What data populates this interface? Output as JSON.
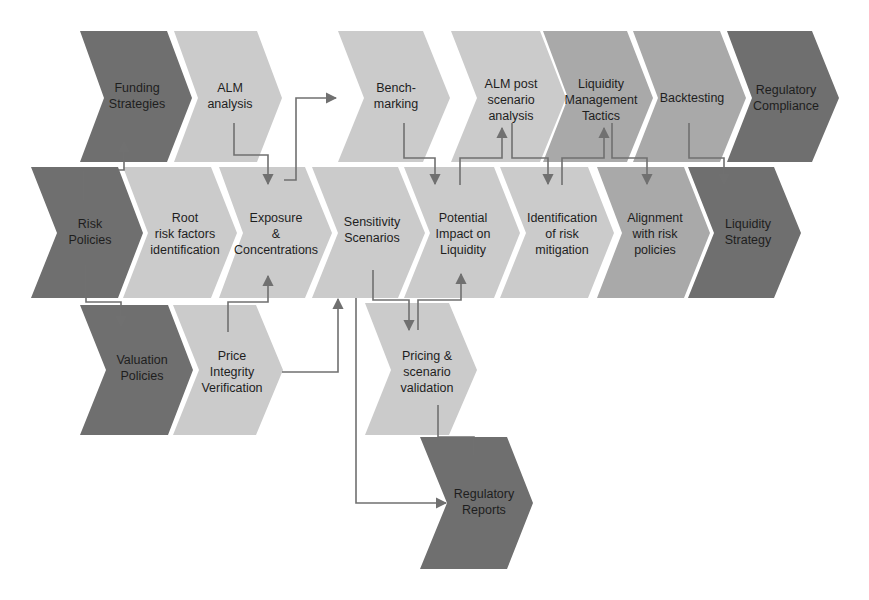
{
  "diagram": {
    "colors": {
      "dark": "#6f6f6f",
      "medium": "#a9a9a9",
      "light": "#cbcbcb",
      "connector": "#707070",
      "text": "#1e1e1e"
    },
    "rows": [
      {
        "name": "row-top",
        "items": [
          {
            "id": "funding-strategies",
            "label": "Funding\nStrategies",
            "shade": "dark"
          },
          {
            "id": "alm-analysis",
            "label": "ALM\nanalysis",
            "shade": "light"
          },
          {
            "id": "benchmarking",
            "label": "Bench-\nmarking",
            "shade": "light"
          },
          {
            "id": "alm-post-scenario-analysis",
            "label": "ALM post\nscenario\nanalysis",
            "shade": "light"
          },
          {
            "id": "liquidity-management-tactics",
            "label": "Liquidity\nManagement\nTactics",
            "shade": "medium"
          },
          {
            "id": "backtesting",
            "label": "Backtesting",
            "shade": "medium"
          },
          {
            "id": "regulatory-compliance",
            "label": "Regulatory\nCompliance",
            "shade": "dark"
          }
        ]
      },
      {
        "name": "row-middle",
        "items": [
          {
            "id": "risk-policies",
            "label": "Risk\nPolicies",
            "shade": "dark"
          },
          {
            "id": "root-risk-factors-identification",
            "label": "Root\nrisk factors\nidentification",
            "shade": "light"
          },
          {
            "id": "exposure-concentrations",
            "label": "Exposure\n&\nConcentrations",
            "shade": "light"
          },
          {
            "id": "sensitivity-scenarios",
            "label": "Sensitivity\nScenarios",
            "shade": "light"
          },
          {
            "id": "potential-impact-on-liquidity",
            "label": "Potential\nImpact on\nLiquidity",
            "shade": "light"
          },
          {
            "id": "identification-of-risk-mitigation",
            "label": "Identification\nof risk\nmitigation",
            "shade": "light"
          },
          {
            "id": "alignment-with-risk-policies",
            "label": "Alignment\nwith risk\npolicies",
            "shade": "medium"
          },
          {
            "id": "liquidity-strategy",
            "label": "Liquidity\nStrategy",
            "shade": "dark"
          }
        ]
      },
      {
        "name": "row-bottom",
        "items": [
          {
            "id": "valuation-policies",
            "label": "Valuation\nPolicies",
            "shade": "dark"
          },
          {
            "id": "price-integrity-verification",
            "label": "Price\nIntegrity\nVerification",
            "shade": "light"
          },
          {
            "id": "pricing-scenario-validation",
            "label": "Pricing &\nscenario\nvalidation",
            "shade": "light"
          },
          {
            "id": "regulatory-reports",
            "label": "Regulatory\nReports",
            "shade": "dark"
          }
        ]
      }
    ],
    "connections": [
      {
        "from": "risk-policies",
        "to": "funding-strategies"
      },
      {
        "from": "risk-policies",
        "to": "valuation-policies"
      },
      {
        "from": "alm-analysis",
        "to": "exposure-concentrations"
      },
      {
        "from": "exposure-concentrations",
        "to": "benchmarking"
      },
      {
        "from": "price-integrity-verification",
        "to": "exposure-concentrations"
      },
      {
        "from": "price-integrity-verification",
        "to": "sensitivity-scenarios"
      },
      {
        "from": "benchmarking",
        "to": "potential-impact-on-liquidity"
      },
      {
        "from": "potential-impact-on-liquidity",
        "to": "alm-post-scenario-analysis"
      },
      {
        "from": "alm-post-scenario-analysis",
        "to": "identification-of-risk-mitigation"
      },
      {
        "from": "identification-of-risk-mitigation",
        "to": "liquidity-management-tactics"
      },
      {
        "from": "liquidity-management-tactics",
        "to": "alignment-with-risk-policies"
      },
      {
        "from": "backtesting",
        "to": "liquidity-strategy"
      },
      {
        "from": "sensitivity-scenarios",
        "to": "pricing-scenario-validation"
      },
      {
        "from": "pricing-scenario-validation",
        "to": "potential-impact-on-liquidity"
      },
      {
        "from": "sensitivity-scenarios",
        "to": "regulatory-reports"
      },
      {
        "from": "pricing-scenario-validation",
        "to": "regulatory-reports"
      }
    ]
  }
}
